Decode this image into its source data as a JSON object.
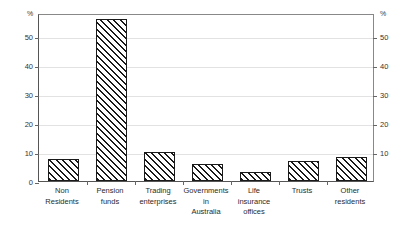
{
  "chart_data": {
    "type": "bar",
    "title": "",
    "subtitle": "",
    "xlabel": "",
    "ylabel": "%",
    "unit_left": "%",
    "unit_right": "%",
    "ylim": [
      0,
      58
    ],
    "grid": true,
    "legend": "none",
    "y_ticks_left": [
      "0",
      "10",
      "20",
      "30",
      "40",
      "50"
    ],
    "y_ticks_right": [
      "10",
      "20",
      "30",
      "40",
      "50"
    ],
    "y_tick_values": [
      0,
      10,
      20,
      30,
      40,
      50
    ],
    "categories": [
      "Non\nResidents",
      "Pension\nfunds",
      "Trading\nenterprises",
      "Governments\nin\nAustralia",
      "Life\ninsurance\noffices",
      "Trusts",
      "Other\nresidents"
    ],
    "values": [
      7.5,
      56,
      10,
      5.8,
      3,
      6.8,
      8.2
    ],
    "series": [
      {
        "name": "Share",
        "values": [
          7.5,
          56,
          10,
          5.8,
          3,
          6.8,
          8.2
        ]
      }
    ],
    "colors": {
      "bar_outline": "#1a1a1a",
      "bar_fill": "#ffffff",
      "hatch": "#1a1a1a",
      "gridline": "#e2e2e2",
      "axis": "#555555",
      "text": "#2b2b2b"
    }
  }
}
